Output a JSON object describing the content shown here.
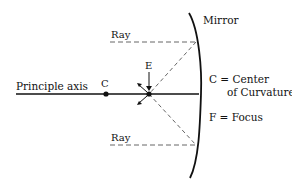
{
  "diagram": {
    "type": "concave-mirror-ray-diagram",
    "labels": {
      "principal_axis": "Principle axis",
      "mirror": "Mirror",
      "ray_top": "Ray",
      "ray_bottom": "Ray",
      "point_c": "C",
      "point_e": "E",
      "legend_c_line1": "C = Center",
      "legend_c_line2": "of Curvature",
      "legend_f": "F = Focus"
    },
    "colors": {
      "line": "#111111",
      "dashed": "#555555",
      "background": "#ffffff"
    }
  }
}
